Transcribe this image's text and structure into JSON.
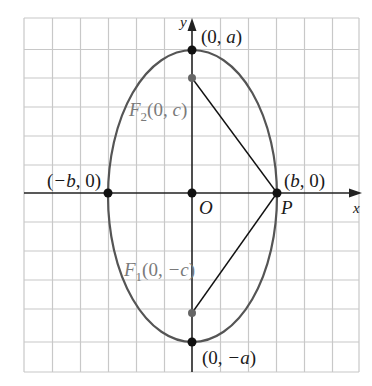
{
  "figure": {
    "colors": {
      "grid": "#c8c8c8",
      "axis": "#222222",
      "ellipse": "#555555",
      "segment": "#111111",
      "point": "#111111",
      "focus_point": "#666666",
      "focus_label": "#7a7a7a",
      "label": "#1a1a1a"
    },
    "axes": {
      "x_label": "x",
      "y_label": "y"
    },
    "labels": {
      "top_vertex": {
        "open": "(0, ",
        "var": "a",
        "close": ")"
      },
      "bottom_vertex": {
        "open": "(0, ",
        "var": "−a",
        "close": ")"
      },
      "left_vertex": {
        "open": "(",
        "var": "−b",
        "close": ", 0)"
      },
      "right_vertex": {
        "open": "(",
        "var": "b",
        "close": ", 0)"
      },
      "origin": "O",
      "point_p": "P",
      "focus_top": {
        "name": "F",
        "sub": "2",
        "coords_open": "(0, ",
        "var": "c",
        "close": ")"
      },
      "focus_bottom": {
        "name": "F",
        "sub": "1",
        "coords_open": "(0, ",
        "var": "−c",
        "close": ")"
      }
    }
  }
}
